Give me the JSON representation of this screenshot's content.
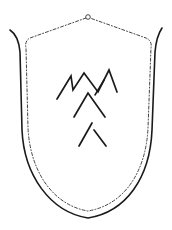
{
  "figure": {
    "subject": "shield with mason's mark",
    "colors": {
      "background": "#ffffff",
      "ink": "#1a1a1a",
      "dashed_ink": "#444444"
    },
    "elements": [
      {
        "name": "outer-shield-outline",
        "style": "solid curved line"
      },
      {
        "name": "inner-dashed-border",
        "style": "dashed line"
      },
      {
        "name": "suspension-ring",
        "style": "small circle at top"
      },
      {
        "name": "zigzag-mark",
        "style": "three-peak zigzag"
      },
      {
        "name": "upper-chevron",
        "style": "inverted V"
      },
      {
        "name": "lower-split-chevron",
        "style": "inverted V with gap at apex"
      }
    ]
  }
}
